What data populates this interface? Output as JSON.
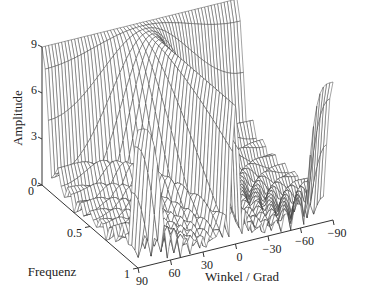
{
  "chart_data": {
    "type": "surface3d",
    "title": "",
    "xlabel": "Winkel / Grad",
    "ylabel": "Frequenz",
    "zlabel": "Amplitude",
    "x_axis": {
      "name": "angle",
      "range": [
        90,
        -90
      ],
      "ticks": [
        90,
        60,
        30,
        0,
        -30,
        -60,
        -90
      ],
      "tick_labels": [
        "90",
        "60",
        "30",
        "0",
        "−30",
        "−60",
        "−90"
      ]
    },
    "y_axis": {
      "name": "frequency",
      "range": [
        0,
        1
      ],
      "ticks": [
        0,
        0.5,
        1
      ],
      "tick_labels": [
        "0",
        "0.5",
        "1"
      ]
    },
    "z_axis": {
      "name": "amplitude",
      "range": [
        0,
        9
      ],
      "ticks": [
        0,
        3,
        6,
        9
      ],
      "tick_labels": [
        "0",
        "3",
        "6",
        "9"
      ]
    },
    "surface": {
      "description": "Array factor magnitude of a 9-element uniform linear array versus normalized frequency and steering angle",
      "function": "|sin(N*pi*f*sin(theta)/2) / sin(pi*f*sin(theta)/2)|",
      "elements": 9,
      "peak_amplitude": 9,
      "main_lobe_angle_deg": 0,
      "grid_angle_steps": 60,
      "grid_freq_steps": 30
    },
    "grid": false,
    "legend": "none",
    "style": {
      "line_color": "#333333",
      "fill_color": "#ffffff"
    }
  }
}
